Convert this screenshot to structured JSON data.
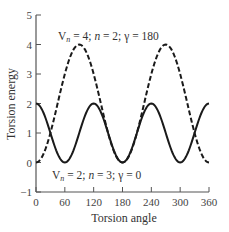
{
  "chart_data": {
    "type": "line",
    "title": "",
    "xlabel": "Torsion angle",
    "ylabel": "Torsion energy",
    "xlim": [
      0,
      360
    ],
    "ylim": [
      -1,
      5
    ],
    "xticks": [
      0,
      60,
      120,
      180,
      240,
      300,
      360
    ],
    "yticks": [
      -1,
      0,
      1,
      2,
      3,
      4,
      5
    ],
    "grid": false,
    "legend": "none (curves annotated inline)",
    "series": [
      {
        "name": "Vn = 4; n = 2; γ = 180",
        "style": "dashed",
        "formula": "(Vn/2)(1 + cos(n·φ − γ))",
        "Vn": 4,
        "n": 2,
        "gamma": 180,
        "x": [
          0,
          30,
          45,
          60,
          90,
          120,
          135,
          150,
          180,
          210,
          225,
          240,
          270,
          300,
          315,
          330,
          360
        ],
        "values": [
          0,
          1,
          2,
          3,
          4,
          3,
          2,
          1,
          0,
          1,
          2,
          3,
          4,
          3,
          2,
          1,
          0
        ]
      },
      {
        "name": "Vn = 2; n = 3; γ = 0",
        "style": "solid",
        "formula": "(Vn/2)(1 + cos(n·φ − γ))",
        "Vn": 2,
        "n": 3,
        "gamma": 0,
        "x": [
          0,
          30,
          60,
          90,
          120,
          150,
          180,
          210,
          240,
          270,
          300,
          330,
          360
        ],
        "values": [
          2,
          1,
          0,
          1,
          2,
          1,
          0,
          1,
          2,
          1,
          0,
          1,
          2
        ]
      }
    ],
    "annotations": [
      {
        "text_parts": [
          "V",
          "n",
          " = 4; ",
          "n",
          " = 2; γ = 180"
        ],
        "near_series": 0,
        "position": "top"
      },
      {
        "text_parts": [
          "V",
          "n",
          " = 2; ",
          "n",
          " = 3; γ = 0"
        ],
        "near_series": 1,
        "position": "bottom"
      }
    ]
  },
  "labels": {
    "xlabel": "Torsion angle",
    "ylabel": "Torsion energy",
    "annot_top": {
      "v": "V",
      "sub": "n",
      "mid": " = 4; ",
      "n": "n",
      "rest": " = 2; γ = 180"
    },
    "annot_bottom": {
      "v": "V",
      "sub": "n",
      "mid": " = 2; ",
      "n": "n",
      "rest": " = 3; γ = 0"
    }
  },
  "ticks": {
    "x": [
      "0",
      "60",
      "120",
      "180",
      "240",
      "300",
      "360"
    ],
    "y": [
      "5",
      "4",
      "3",
      "2",
      "1",
      "0",
      "−1"
    ]
  },
  "colors": {
    "axis": "#555555",
    "curve": "#1a1a1a",
    "text": "#333333"
  }
}
